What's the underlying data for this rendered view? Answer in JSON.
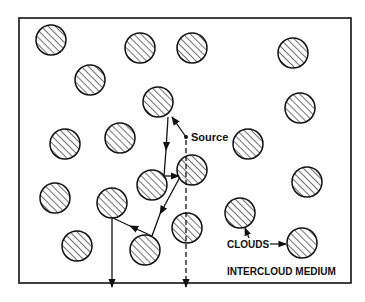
{
  "diagram": {
    "frame": {
      "x": 19,
      "y": 18,
      "w": 332,
      "h": 265
    },
    "stroke_color": "#111111",
    "background_color": "#ffffff",
    "labels": {
      "source": "Source",
      "clouds": "CLOUDS",
      "intercloud_medium": "INTERCLOUD MEDIUM"
    },
    "cloud_radius": 15,
    "clouds": [
      {
        "cx": 51,
        "cy": 40
      },
      {
        "cx": 140,
        "cy": 48
      },
      {
        "cx": 192,
        "cy": 48
      },
      {
        "cx": 293,
        "cy": 53
      },
      {
        "cx": 90,
        "cy": 80
      },
      {
        "cx": 158,
        "cy": 102
      },
      {
        "cx": 300,
        "cy": 108
      },
      {
        "cx": 65,
        "cy": 144
      },
      {
        "cx": 120,
        "cy": 138
      },
      {
        "cx": 248,
        "cy": 144
      },
      {
        "cx": 152,
        "cy": 185
      },
      {
        "cx": 192,
        "cy": 170
      },
      {
        "cx": 307,
        "cy": 182
      },
      {
        "cx": 55,
        "cy": 198
      },
      {
        "cx": 112,
        "cy": 203
      },
      {
        "cx": 240,
        "cy": 213
      },
      {
        "cx": 187,
        "cy": 228
      },
      {
        "cx": 77,
        "cy": 246
      },
      {
        "cx": 145,
        "cy": 250
      },
      {
        "cx": 302,
        "cy": 243
      }
    ],
    "source_point": {
      "x": 186,
      "y": 137
    },
    "scattered_path": [
      [
        186,
        137
      ],
      [
        170,
        115
      ],
      [
        164,
        178
      ],
      [
        180,
        176
      ],
      [
        152,
        236
      ],
      [
        112,
        218
      ],
      [
        112,
        288
      ]
    ],
    "direct_path_dashed": [
      [
        186,
        140
      ],
      [
        186,
        288
      ]
    ]
  }
}
